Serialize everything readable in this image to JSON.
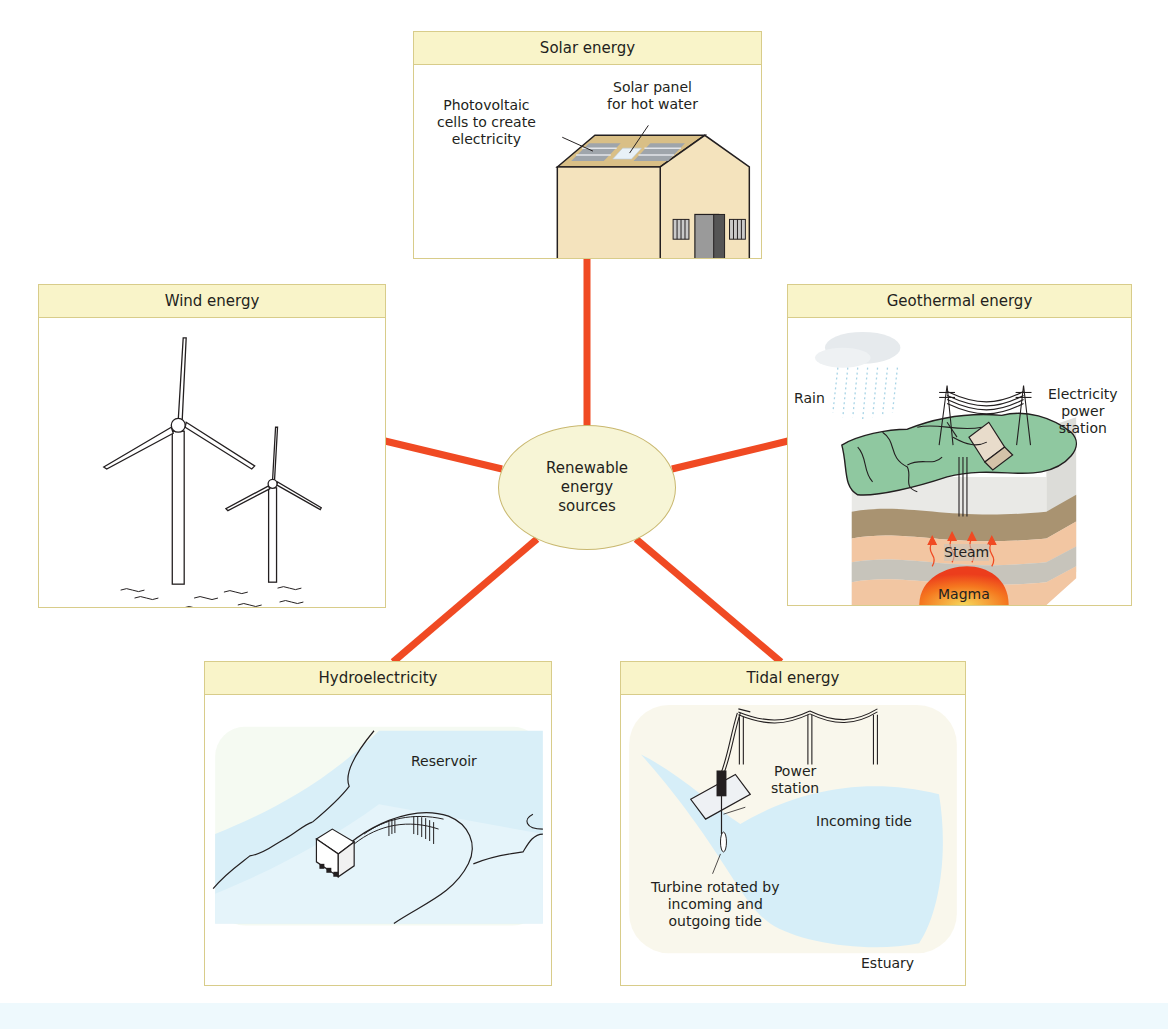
{
  "diagram": {
    "hub": {
      "label": "Renewable\nenergy\nsources",
      "line1": "Renewable",
      "line2": "energy",
      "line3": "sources",
      "fill": "#f7f5d6"
    },
    "connector_color": "#f04a23",
    "header_fill": "#f9f4c9",
    "border_color": "#d8cc8a",
    "panels": {
      "solar": {
        "title": "Solar energy",
        "labels": {
          "hot_water": [
            "Solar panel",
            "for hot water"
          ],
          "photovoltaic": [
            "Photovoltaic",
            "cells to create",
            "electricity"
          ]
        }
      },
      "wind": {
        "title": "Wind energy"
      },
      "geothermal": {
        "title": "Geothermal energy",
        "labels": {
          "rain": "Rain",
          "power_station": [
            "Electricity",
            "power",
            "station"
          ],
          "steam": "Steam",
          "magma": "Magma"
        }
      },
      "hydro": {
        "title": "Hydroelectricity",
        "labels": {
          "reservoir": "Reservoir"
        }
      },
      "tidal": {
        "title": "Tidal energy",
        "labels": {
          "power_station": [
            "Power",
            "station"
          ],
          "incoming_tide": "Incoming tide",
          "turbine": [
            "Turbine rotated by",
            "incoming and",
            "outgoing tide"
          ],
          "estuary": "Estuary"
        }
      }
    }
  }
}
